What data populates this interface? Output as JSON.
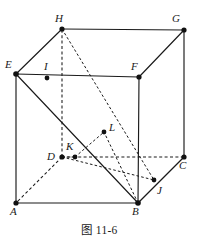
{
  "figure": {
    "caption": "图 11-6",
    "type": "geometric-diagram",
    "stroke_color": "#1a1a1a",
    "background_color": "#ffffff",
    "vertex_labels": {
      "A": "A",
      "B": "B",
      "C": "C",
      "D": "D",
      "E": "E",
      "F": "F",
      "G": "G",
      "H": "H",
      "I": "I",
      "J": "J",
      "K": "K",
      "L": "L"
    },
    "points": [
      {
        "id": "A",
        "label": "A",
        "x": 16,
        "y": 203,
        "label_x": 11,
        "label_y": 206,
        "kind": "cube-vertex"
      },
      {
        "id": "B",
        "label": "B",
        "x": 138,
        "y": 203,
        "label_x": 134,
        "label_y": 206,
        "kind": "cube-vertex"
      },
      {
        "id": "C",
        "label": "C",
        "x": 184,
        "y": 157,
        "label_x": 180,
        "label_y": 161,
        "kind": "cube-vertex"
      },
      {
        "id": "D",
        "label": "D",
        "x": 62,
        "y": 157,
        "label_x": 48,
        "label_y": 152,
        "kind": "cube-vertex"
      },
      {
        "id": "E",
        "label": "E",
        "x": 16,
        "y": 74,
        "label_x": 5,
        "label_y": 60,
        "kind": "cube-vertex"
      },
      {
        "id": "F",
        "label": "F",
        "x": 139,
        "y": 77,
        "label_x": 131,
        "label_y": 62,
        "kind": "cube-vertex"
      },
      {
        "id": "G",
        "label": "G",
        "x": 184,
        "y": 30,
        "label_x": 173,
        "label_y": 15,
        "kind": "cube-vertex"
      },
      {
        "id": "H",
        "label": "H",
        "x": 62,
        "y": 29,
        "label_x": 56,
        "label_y": 14,
        "kind": "cube-vertex"
      },
      {
        "id": "I",
        "label": "I",
        "x": 47,
        "y": 78,
        "label_x": 44,
        "label_y": 62,
        "kind": "marked-point"
      },
      {
        "id": "J",
        "label": "J",
        "x": 154,
        "y": 180,
        "label_x": 157,
        "label_y": 185,
        "kind": "marked-point"
      },
      {
        "id": "K",
        "label": "K",
        "x": 75,
        "y": 157,
        "label_x": 66,
        "label_y": 142,
        "kind": "marked-point"
      },
      {
        "id": "L",
        "label": "L",
        "x": 104,
        "y": 132,
        "label_x": 109,
        "label_y": 124,
        "kind": "marked-point"
      }
    ],
    "edges_solid": [
      {
        "name": "A-B",
        "from": "A",
        "to": "B"
      },
      {
        "name": "A-E",
        "from": "A",
        "to": "E"
      },
      {
        "name": "B-F",
        "from": "B",
        "to": "F"
      },
      {
        "name": "E-F",
        "from": "E",
        "to": "F"
      },
      {
        "name": "E-H",
        "from": "E",
        "to": "H"
      },
      {
        "name": "F-G",
        "from": "F",
        "to": "G"
      },
      {
        "name": "H-G",
        "from": "H",
        "to": "G"
      },
      {
        "name": "G-C",
        "from": "G",
        "to": "C"
      },
      {
        "name": "B-C",
        "from": "B",
        "to": "C"
      },
      {
        "name": "E-B-diagonal",
        "from": "E",
        "to": "B"
      }
    ],
    "edges_dashed": [
      {
        "name": "D-A",
        "from": "D",
        "to": "A"
      },
      {
        "name": "D-C",
        "from": "D",
        "to": "C"
      },
      {
        "name": "D-H",
        "from": "D",
        "to": "H"
      },
      {
        "name": "H-J-diagonal",
        "from": "H",
        "to": "J"
      },
      {
        "name": "B-L-segment",
        "from": "B",
        "to": "L"
      },
      {
        "name": "K-L-segment",
        "from": "K",
        "to": "L"
      },
      {
        "name": "D-K-segment",
        "from": "D",
        "to": "K"
      },
      {
        "name": "B-J-segment",
        "from": "B",
        "to": "J"
      }
    ]
  }
}
